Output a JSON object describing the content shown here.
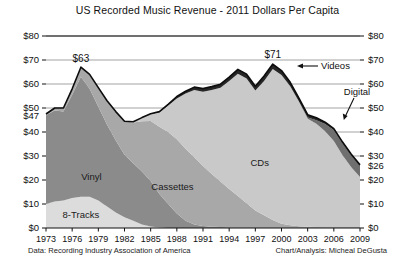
{
  "chart_data": {
    "type": "area",
    "title": "US Recorded Music Revenue - 2011 Dollars Per Capita",
    "xlabel": "",
    "ylabel": "",
    "stacked": true,
    "grid": true,
    "legend_position": "inline-annotations",
    "ylim": [
      0,
      80
    ],
    "xlim": [
      1973,
      2009
    ],
    "y_ticks": [
      "$0",
      "$10",
      "$20",
      "$30",
      "$40",
      "$50",
      "$60",
      "$70",
      "$80"
    ],
    "y_tick_values": [
      0,
      10,
      20,
      30,
      40,
      50,
      60,
      70,
      80
    ],
    "y_axis_right_ticks": [
      "$0",
      "$10",
      "$20",
      "$30",
      "$40",
      "$50",
      "$60",
      "$70",
      "$80"
    ],
    "x_ticks": [
      "1973",
      "1976",
      "1979",
      "1982",
      "1985",
      "1988",
      "1991",
      "1994",
      "1997",
      "2000",
      "2003",
      "2006",
      "2009"
    ],
    "x_tick_values": [
      1973,
      1976,
      1979,
      1982,
      1985,
      1988,
      1991,
      1994,
      1997,
      2000,
      2003,
      2006,
      2009
    ],
    "x": [
      1973,
      1974,
      1975,
      1976,
      1977,
      1978,
      1979,
      1980,
      1981,
      1982,
      1983,
      1984,
      1985,
      1986,
      1987,
      1988,
      1989,
      1990,
      1991,
      1992,
      1993,
      1994,
      1995,
      1996,
      1997,
      1998,
      1999,
      2000,
      2001,
      2002,
      2003,
      2004,
      2005,
      2006,
      2007,
      2008,
      2009
    ],
    "series": [
      {
        "name": "8-Tracks",
        "color": "#dcdcdc",
        "values": [
          10,
          11,
          11.5,
          12.5,
          13,
          13,
          11.5,
          9,
          6.5,
          4.5,
          3,
          1.5,
          0.6,
          0.2,
          0,
          0,
          0,
          0,
          0,
          0,
          0,
          0,
          0,
          0,
          0,
          0,
          0,
          0,
          0,
          0,
          0,
          0,
          0,
          0,
          0,
          0,
          0
        ]
      },
      {
        "name": "Vinyl",
        "color": "#8b8b8b",
        "values": [
          37,
          38,
          37,
          43,
          50,
          45,
          39,
          34,
          30,
          26,
          24,
          22,
          19,
          14,
          10,
          6,
          3,
          1.5,
          0.8,
          0.5,
          0.4,
          0.3,
          0.3,
          0.3,
          0.3,
          0.3,
          0.3,
          0.3,
          0.3,
          0.3,
          0.3,
          0.3,
          0.3,
          0.3,
          0.3,
          0.3,
          0.3
        ]
      },
      {
        "name": "Cassettes",
        "color": "#a8a8a8",
        "values": [
          0.5,
          1,
          1.5,
          2.5,
          4,
          6,
          8,
          10,
          12,
          14,
          17,
          21,
          25,
          28,
          30,
          31,
          30,
          28,
          25,
          22,
          19,
          16,
          13,
          10,
          7,
          5,
          3,
          1.5,
          0.8,
          0.4,
          0.2,
          0.1,
          0,
          0,
          0,
          0,
          0
        ]
      },
      {
        "name": "CDs",
        "color": "#c9c9c9",
        "values": [
          0,
          0,
          0,
          0,
          0,
          0,
          0,
          0,
          0,
          0,
          0.3,
          1.5,
          3,
          6,
          11,
          17,
          23,
          28,
          31,
          35,
          39,
          45,
          51,
          52,
          50,
          56,
          63,
          62,
          58,
          52,
          45,
          43,
          40,
          36,
          30,
          25,
          21
        ]
      },
      {
        "name": "Digital",
        "color": "#6f6f6f",
        "values": [
          0,
          0,
          0,
          0,
          0,
          0,
          0,
          0,
          0,
          0,
          0,
          0,
          0,
          0,
          0,
          0,
          0,
          0,
          0,
          0,
          0,
          0,
          0,
          0,
          0,
          0,
          0,
          0,
          0,
          0,
          0.5,
          1.5,
          3,
          4.5,
          5,
          5,
          4.7
        ]
      },
      {
        "name": "Videos",
        "color": "#262626",
        "values": [
          0,
          0,
          0,
          0,
          0,
          0,
          0,
          0,
          0,
          0,
          0,
          0,
          0,
          0.3,
          0.5,
          0.8,
          1,
          1.2,
          1.3,
          1.4,
          1.5,
          1.6,
          1.8,
          1.8,
          1.8,
          2,
          2,
          1.8,
          1.6,
          1.4,
          1.2,
          1,
          0.8,
          0.6,
          0.5,
          0.4,
          0.3
        ]
      }
    ],
    "totals": [
      47.5,
      50,
      50,
      58,
      67,
      64,
      58.5,
      53,
      48.5,
      44.5,
      44.3,
      46,
      47.6,
      48.5,
      51.5,
      54.8,
      57,
      58.7,
      58.1,
      58.9,
      59.9,
      62.9,
      66.1,
      64.1,
      59.1,
      63.3,
      68.3,
      65.6,
      60.7,
      54.1,
      47.2,
      45.9,
      44.1,
      41.4,
      35.8,
      30.7,
      26.0
    ],
    "annotations": [
      {
        "name": "start-value",
        "text": "$47",
        "axis": "left",
        "value": 47
      },
      {
        "name": "peak-1978",
        "text": "$63",
        "year": 1977,
        "value": 67
      },
      {
        "name": "peak-1999",
        "text": "$71",
        "year": 1999,
        "value": 68.3
      },
      {
        "name": "end-value",
        "text": "$26",
        "axis": "right",
        "value": 26
      },
      {
        "name": "videos-callout",
        "text": "Videos"
      },
      {
        "name": "digital-callout",
        "text": "Digital"
      }
    ],
    "inline_labels": [
      {
        "name": "vinyl",
        "text": "Vinyl"
      },
      {
        "name": "8-tracks",
        "text": "8-Tracks"
      },
      {
        "name": "cassettes",
        "text": "Cassettes"
      },
      {
        "name": "cds",
        "text": "CDs"
      }
    ]
  },
  "footer": {
    "data_source": "Data: Recording Industry Association of America",
    "credit": "Chart/Analysis: Micheal DeGusta"
  }
}
